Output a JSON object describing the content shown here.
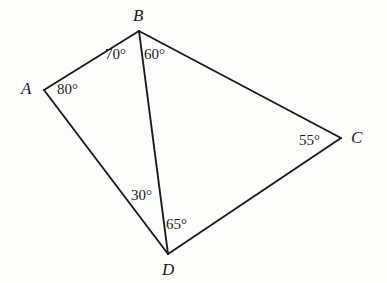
{
  "figure": {
    "type": "geometry-diagram",
    "shape": "quadrilateral-with-diagonal",
    "background_color": "#fdfdfb",
    "stroke_color": "#1b1b1b",
    "text_color": "#1b1b1b",
    "width": 387,
    "height": 283,
    "vertices": [
      {
        "name": "A",
        "label": "A",
        "x": 44,
        "y": 90
      },
      {
        "name": "B",
        "label": "B",
        "x": 139,
        "y": 31
      },
      {
        "name": "C",
        "label": "C",
        "x": 341,
        "y": 138
      },
      {
        "name": "D",
        "label": "D",
        "x": 168,
        "y": 254
      }
    ],
    "segments": [
      {
        "name": "segment-AB",
        "from": "A",
        "to": "B"
      },
      {
        "name": "segment-BC",
        "from": "B",
        "to": "C"
      },
      {
        "name": "segment-CD",
        "from": "C",
        "to": "D"
      },
      {
        "name": "segment-DA",
        "from": "D",
        "to": "A"
      },
      {
        "name": "segment-BD",
        "from": "B",
        "to": "D"
      }
    ],
    "angles": [
      {
        "name": "angle-A",
        "vertex": "A",
        "label": "80°",
        "value": 80
      },
      {
        "name": "angle-ABD",
        "vertex": "B",
        "label": "70°",
        "value": 70
      },
      {
        "name": "angle-DBC",
        "vertex": "B",
        "label": "60°",
        "value": 60
      },
      {
        "name": "angle-C",
        "vertex": "C",
        "label": "55°",
        "value": 55
      },
      {
        "name": "angle-ADB",
        "vertex": "D",
        "label": "30°",
        "value": 30
      },
      {
        "name": "angle-BDC",
        "vertex": "D",
        "label": "65°",
        "value": 65
      }
    ]
  }
}
